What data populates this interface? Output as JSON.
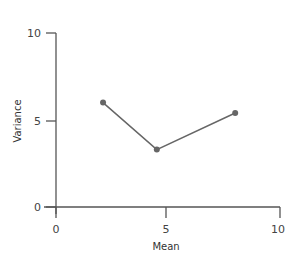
{
  "chart_data": {
    "type": "line",
    "title": "",
    "xlabel": "Mean",
    "ylabel": "Variance",
    "xlim": [
      0,
      10
    ],
    "ylim": [
      0,
      10
    ],
    "xticks": [
      "0",
      "5",
      "10"
    ],
    "yticks": [
      "0",
      "5",
      "10"
    ],
    "grid": false,
    "legend": null,
    "series": [
      {
        "name": "",
        "x": [
          2.1,
          4.5,
          8.0
        ],
        "y": [
          6.0,
          3.3,
          5.4
        ],
        "color": "#666666",
        "marker": "circle"
      }
    ]
  },
  "colors": {
    "axis": "#555555",
    "line": "#666666",
    "marker": "#666666"
  }
}
